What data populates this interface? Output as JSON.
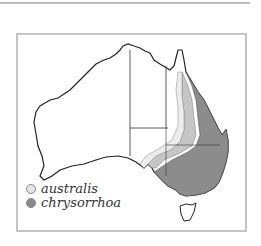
{
  "map": {
    "region": "Australia",
    "legend": [
      {
        "label": "australis",
        "color": "#e6e6e6"
      },
      {
        "label": "chrysorrhoa",
        "color": "#8a8a8a"
      }
    ]
  }
}
